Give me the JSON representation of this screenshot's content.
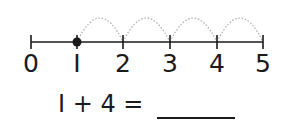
{
  "number_line": {
    "ticks": [
      "0",
      "I",
      "2",
      "3",
      "4",
      "5"
    ],
    "start_point": "1",
    "jumps": 4
  },
  "equation": {
    "text": "I + 4 =",
    "answer_blank": ""
  },
  "colors": {
    "line": "#1a1a1a",
    "arc": "#aaaaaa"
  }
}
